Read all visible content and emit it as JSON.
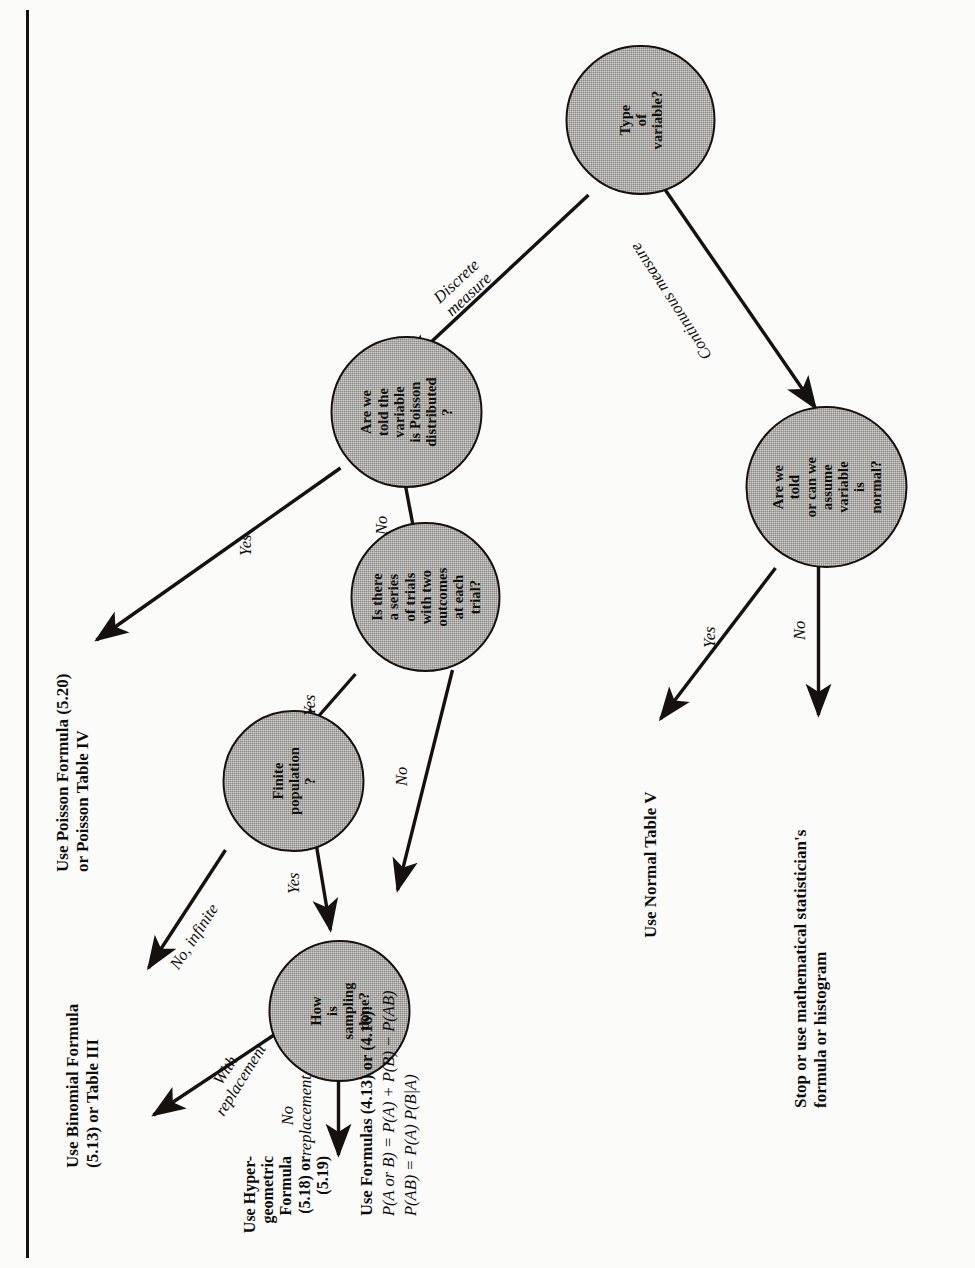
{
  "diagram": {
    "orientation": "rotated-90",
    "colors": {
      "node_fill": "#cfcdc8",
      "stroke": "#14110f",
      "page": "#fbfbf9"
    },
    "nodes": [
      {
        "id": "type-of-variable",
        "label": "Type\nof\nvariable?"
      },
      {
        "id": "poisson-question",
        "label": "Are we\ntold the\nvariable\nis Poisson\ndistributed\n?"
      },
      {
        "id": "trials-question",
        "label": "Is there\na series\nof trials\nwith two\noutcomes\nat each\ntrial?"
      },
      {
        "id": "finite-population",
        "label": "Finite\npopulation\n?"
      },
      {
        "id": "sampling-question",
        "label": "How\nis\nsampling\ndone?"
      },
      {
        "id": "normal-question",
        "label": "Are we\ntold\nor can we\nassume\nvariable\nis\nnormal?"
      }
    ],
    "terminals": [
      {
        "id": "poisson-result",
        "label": "Use Poisson Formula (5.20)\nor Poisson Table IV"
      },
      {
        "id": "binomial-result",
        "label": "Use Binomial Formula\n(5.13) or Table III"
      },
      {
        "id": "hypergeometric-result",
        "label": "Use Hyper-\ngeometric\nFormula\n(5.18) or\n(5.19)"
      },
      {
        "id": "normal-table-result",
        "label": "Use Normal Table V"
      },
      {
        "id": "stop-result",
        "label": "Stop or use mathematical statistician's\nformula or histogram"
      }
    ],
    "formula_block": {
      "id": "probability-formulas",
      "heading": "Use Formulas (4.13) or (4.16):",
      "lines": [
        "P(A or B) = P(A) + P(B) − P(AB)",
        "P(AB) = P(A) P(B|A)"
      ]
    },
    "edge_labels": [
      {
        "id": "discrete-measure",
        "label": "Discrete\nmeasure"
      },
      {
        "id": "continuous-measure",
        "label": "Continuous measure"
      },
      {
        "id": "poisson-yes",
        "label": "Yes"
      },
      {
        "id": "poisson-no",
        "label": "No"
      },
      {
        "id": "trials-yes",
        "label": "Yes"
      },
      {
        "id": "trials-no",
        "label": "No"
      },
      {
        "id": "finite-no-infinite",
        "label": "No, infinite"
      },
      {
        "id": "finite-yes",
        "label": "Yes"
      },
      {
        "id": "with-replacement",
        "label": "With\nreplacement"
      },
      {
        "id": "no-replacement",
        "label": "No\nreplacement"
      },
      {
        "id": "normal-yes",
        "label": "Yes"
      },
      {
        "id": "normal-no",
        "label": "No"
      }
    ]
  }
}
